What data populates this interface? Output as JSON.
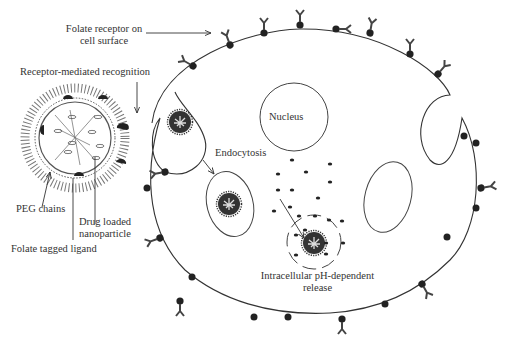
{
  "diagram": {
    "labels": {
      "folate_receptor_line1": "Folate receptor on",
      "folate_receptor_line2": "cell surface",
      "receptor_recognition": "Receptor-mediated recognition",
      "nucleus": "Nucleus",
      "endocytosis": "Endocytosis",
      "peg_chains": "PEG chains",
      "drug_loaded_line1": "Drug loaded",
      "drug_loaded_line2": "nanoparticle",
      "folate_ligand": "Folate tagged ligand",
      "release_line1": "Intracellular pH-dependent",
      "release_line2": "release"
    },
    "colors": {
      "stroke": "#333333",
      "fill_dark": "#2a2a2a",
      "background": "#ffffff"
    }
  }
}
